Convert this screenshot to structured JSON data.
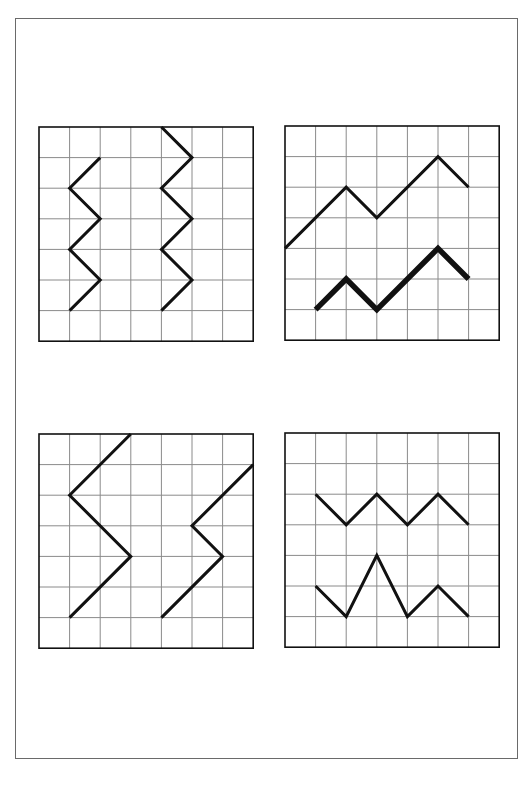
{
  "colors": {
    "grid_line": "#8a8a8a",
    "frame": "#111111",
    "stroke": "#111111",
    "border": "#6a6a6a"
  },
  "grid": {
    "cols": 7,
    "rows": 7
  },
  "panels": [
    {
      "id": "top-left",
      "position": {
        "x": 39,
        "y": 127
      },
      "polylines": [
        {
          "name": "left-zigzag",
          "width": 3,
          "points": [
            [
              2,
              1
            ],
            [
              1,
              2
            ],
            [
              2,
              3
            ],
            [
              1,
              4
            ],
            [
              2,
              5
            ],
            [
              1,
              6
            ]
          ]
        },
        {
          "name": "right-zigzag",
          "width": 3,
          "points": [
            [
              4,
              0
            ],
            [
              5,
              1
            ],
            [
              4,
              2
            ],
            [
              5,
              3
            ],
            [
              4,
              4
            ],
            [
              5,
              5
            ],
            [
              4,
              6
            ]
          ]
        }
      ]
    },
    {
      "id": "top-right",
      "position": {
        "x": 285,
        "y": 126
      },
      "polylines": [
        {
          "name": "upper-line",
          "width": 3,
          "points": [
            [
              0,
              4
            ],
            [
              2,
              2
            ],
            [
              3,
              3
            ],
            [
              5,
              1
            ],
            [
              6,
              2
            ]
          ]
        },
        {
          "name": "lower-thick-line",
          "width": 5.5,
          "points": [
            [
              1,
              6
            ],
            [
              2,
              5
            ],
            [
              3,
              6
            ],
            [
              5,
              4
            ],
            [
              6,
              5
            ]
          ]
        }
      ]
    },
    {
      "id": "bottom-left",
      "position": {
        "x": 39,
        "y": 434
      },
      "polylines": [
        {
          "name": "left-zigzag",
          "width": 3,
          "points": [
            [
              3,
              0
            ],
            [
              1,
              2
            ],
            [
              3,
              4
            ],
            [
              1,
              6
            ]
          ]
        },
        {
          "name": "right-zigzag",
          "width": 3,
          "points": [
            [
              7,
              1
            ],
            [
              5,
              3
            ],
            [
              6,
              4
            ],
            [
              4,
              6
            ]
          ]
        }
      ]
    },
    {
      "id": "bottom-right",
      "position": {
        "x": 285,
        "y": 433
      },
      "polylines": [
        {
          "name": "upper-zigzag",
          "width": 3,
          "points": [
            [
              1,
              2
            ],
            [
              2,
              3
            ],
            [
              3,
              2
            ],
            [
              4,
              3
            ],
            [
              5,
              2
            ],
            [
              6,
              3
            ]
          ]
        },
        {
          "name": "lower-zigzag",
          "width": 3,
          "points": [
            [
              1,
              5
            ],
            [
              2,
              6
            ],
            [
              3,
              4
            ],
            [
              4,
              6
            ],
            [
              5,
              5
            ],
            [
              6,
              6
            ]
          ]
        }
      ]
    }
  ]
}
